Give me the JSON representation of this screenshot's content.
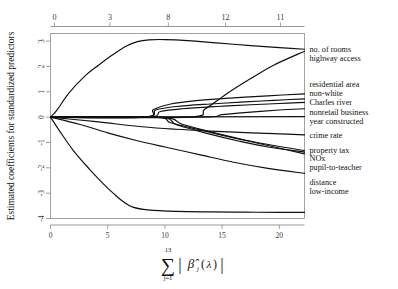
{
  "chart_data": {
    "type": "line",
    "title": "",
    "xlabel": "sum_{j=1}^{13} |beta_hat_j(lambda)|",
    "ylabel": "Estimated coefficients for standardized predictors",
    "xlim": [
      0,
      22.2
    ],
    "ylim": [
      -4,
      3.3
    ],
    "grid": false,
    "legend_position": "right-outside",
    "x_ticks": [
      "0",
      "5",
      "10",
      "15",
      "20"
    ],
    "x_tick_values": [
      0,
      5,
      10,
      15,
      20
    ],
    "y_ticks": [
      "3",
      "2",
      "1",
      "0",
      "-1",
      "-2",
      "-3",
      "-4"
    ],
    "y_tick_values": [
      3,
      2,
      1,
      0,
      -1,
      -2,
      -3,
      -4
    ],
    "top_axis_label": "",
    "top_ticks": [
      "0",
      "3",
      "8",
      "12",
      "11"
    ],
    "top_tick_values": [
      0,
      3,
      8,
      12,
      11
    ],
    "top_tick_x": [
      0.35,
      5.2,
      10.3,
      15.3,
      20.1
    ],
    "series": [
      {
        "name": "no. of rooms",
        "label": "no. of rooms",
        "x": [
          0.0,
          0.6,
          1.6,
          3.0,
          4.2,
          5.4,
          6.6,
          7.6,
          8.6,
          10.0,
          12.0,
          14.5,
          17.5,
          20.0,
          22.2
        ],
        "y": [
          0.0,
          0.3,
          0.95,
          1.62,
          2.05,
          2.45,
          2.8,
          2.98,
          3.05,
          3.06,
          3.02,
          2.93,
          2.82,
          2.74,
          2.68
        ]
      },
      {
        "name": "highway access",
        "label": "highway access",
        "x": [
          0.0,
          12.0,
          13.5,
          15.5,
          17.5,
          19.5,
          22.2
        ],
        "y": [
          0.0,
          0.0,
          0.32,
          0.95,
          1.52,
          2.05,
          2.6
        ]
      },
      {
        "name": "residential area",
        "label": "residential area",
        "x": [
          0.0,
          8.2,
          9.0,
          10.5,
          13.0,
          16.0,
          19.0,
          22.2
        ],
        "y": [
          0.0,
          0.0,
          0.3,
          0.52,
          0.66,
          0.76,
          0.84,
          0.92
        ]
      },
      {
        "name": "non-white",
        "label": "non-white",
        "x": [
          0.0,
          8.2,
          9.2,
          11.0,
          14.0,
          17.0,
          19.5,
          22.2
        ],
        "y": [
          0.0,
          0.0,
          0.28,
          0.42,
          0.52,
          0.6,
          0.66,
          0.72
        ]
      },
      {
        "name": "Charles river",
        "label": "Charles river",
        "x": [
          0.0,
          8.4,
          9.6,
          11.5,
          14.5,
          17.5,
          20.0,
          22.2
        ],
        "y": [
          0.0,
          0.0,
          0.22,
          0.33,
          0.42,
          0.49,
          0.54,
          0.58
        ]
      },
      {
        "name": "nonretail business",
        "label": "nonretail business",
        "x": [
          0.0,
          13.0,
          15.0,
          17.5,
          20.0,
          22.2
        ],
        "y": [
          0.0,
          0.0,
          0.1,
          0.2,
          0.28,
          0.33
        ]
      },
      {
        "name": "year constructed",
        "label": "year constructed",
        "x": [
          0.0,
          22.2
        ],
        "y": [
          0.0,
          0.02
        ]
      },
      {
        "name": "crime rate",
        "label": "crime rate",
        "x": [
          0.0,
          4.0,
          8.0,
          11.0,
          14.0,
          17.5,
          20.0,
          22.2
        ],
        "y": [
          0.0,
          -0.18,
          -0.38,
          -0.48,
          -0.55,
          -0.62,
          -0.66,
          -0.7
        ]
      },
      {
        "name": "property tax",
        "label": "property tax",
        "x": [
          0.0,
          9.5,
          11.5,
          14.0,
          17.0,
          19.5,
          22.2
        ],
        "y": [
          0.0,
          0.0,
          -0.28,
          -0.58,
          -0.9,
          -1.12,
          -1.32
        ]
      },
      {
        "name": "NOx",
        "label": "NOx",
        "x": [
          0.0,
          9.3,
          11.0,
          13.5,
          16.5,
          19.0,
          22.2
        ],
        "y": [
          0.0,
          0.0,
          -0.3,
          -0.62,
          -0.95,
          -1.18,
          -1.38
        ]
      },
      {
        "name": "pupil-to-teacher",
        "label": "pupil-to-teacher",
        "x": [
          0.0,
          9.0,
          10.5,
          13.0,
          16.0,
          19.0,
          22.2
        ],
        "y": [
          0.0,
          0.0,
          -0.22,
          -0.5,
          -0.82,
          -1.12,
          -1.45
        ]
      },
      {
        "name": "distance",
        "label": "distance",
        "x": [
          0.0,
          2.5,
          5.0,
          7.5,
          10.0,
          13.0,
          16.0,
          19.0,
          22.2
        ],
        "y": [
          0.0,
          -0.28,
          -0.62,
          -0.92,
          -1.18,
          -1.48,
          -1.78,
          -2.02,
          -2.22
        ]
      },
      {
        "name": "low-income",
        "label": "low-income",
        "x": [
          0.0,
          0.8,
          2.0,
          3.4,
          4.6,
          5.6,
          6.4,
          7.2,
          8.5,
          11.0,
          14.0,
          17.0,
          20.0,
          22.2
        ],
        "y": [
          0.0,
          -0.55,
          -1.32,
          -2.05,
          -2.62,
          -3.05,
          -3.35,
          -3.55,
          -3.66,
          -3.72,
          -3.74,
          -3.75,
          -3.76,
          -3.76
        ]
      }
    ],
    "right_labels": [
      {
        "text": "no. of rooms",
        "y": 2.68
      },
      {
        "text": "highway access",
        "y": 2.32
      },
      {
        "text": "residential area",
        "y": 1.32
      },
      {
        "text": "non-white",
        "y": 0.95
      },
      {
        "text": "Charles river",
        "y": 0.58
      },
      {
        "text": "nonretail business",
        "y": 0.22
      },
      {
        "text": "year constructed",
        "y": -0.14
      },
      {
        "text": "crime rate",
        "y": -0.72
      },
      {
        "text": "property tax",
        "y": -1.3
      },
      {
        "text": "NOx",
        "y": -1.62
      },
      {
        "text": "pupil-to-teacher",
        "y": -1.96
      },
      {
        "text": "distance",
        "y": -2.56
      },
      {
        "text": "low-income",
        "y": -2.92
      }
    ],
    "formula": {
      "sigma": "∑",
      "upper": "13",
      "lower": "j=1",
      "bar_left": "|",
      "beta": "β̂",
      "subscript": "j",
      "paren_open": "(",
      "lambda": "λ",
      "paren_close": ")",
      "bar_right": "|"
    }
  }
}
